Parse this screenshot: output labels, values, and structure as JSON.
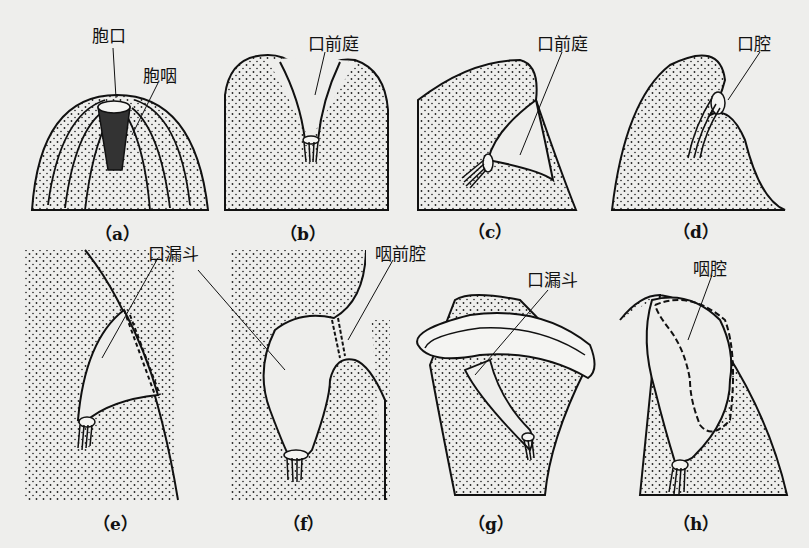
{
  "figure": {
    "title": "",
    "panels": [
      {
        "id": "a",
        "caption": "（a）",
        "labels": [
          "胞口",
          "胞咽"
        ]
      },
      {
        "id": "b",
        "caption": "（b）",
        "labels": [
          "口前庭"
        ]
      },
      {
        "id": "c",
        "caption": "（c）",
        "labels": [
          "口前庭"
        ]
      },
      {
        "id": "d",
        "caption": "（d）",
        "labels": [
          "口腔"
        ]
      },
      {
        "id": "e",
        "caption": "（e）",
        "labels": [
          "口漏斗"
        ]
      },
      {
        "id": "f",
        "caption": "（f）",
        "labels": [
          "咽前腔"
        ]
      },
      {
        "id": "g",
        "caption": "（g）",
        "labels": [
          "口漏斗"
        ]
      },
      {
        "id": "h",
        "caption": "（h）",
        "labels": [
          "咽腔"
        ]
      }
    ]
  }
}
